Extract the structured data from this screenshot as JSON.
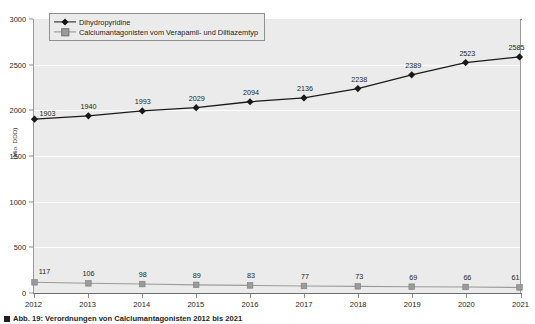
{
  "chart_data": {
    "type": "line",
    "title": "",
    "subtitle": "",
    "xlabel": "",
    "ylabel": "(Mio. DDD)",
    "categories": [
      "2012",
      "2013",
      "2014",
      "2015",
      "2016",
      "2017",
      "2018",
      "2019",
      "2020",
      "2021"
    ],
    "ylim": [
      0,
      3000
    ],
    "y_ticks": [
      0,
      500,
      1000,
      1500,
      2000,
      2500,
      3000
    ],
    "y_tick_labels": [
      "0",
      "500",
      "1000",
      "1500",
      "2000",
      "2500",
      "3000"
    ],
    "grid": true,
    "legend_position": "top-left",
    "series": [
      {
        "name": "Dihydropyridine",
        "marker": "diamond",
        "color": "#1a1a1a",
        "values": [
          1903,
          1940,
          1993,
          2029,
          2094,
          2136,
          2238,
          2389,
          2523,
          2585
        ],
        "labels": [
          "1903",
          "1940",
          "1993",
          "2029",
          "2094",
          "2136",
          "2238",
          "2389",
          "2523",
          "2585"
        ]
      },
      {
        "name": "Calciumantagonisten vom Verapamil- und Diltiazemtyp",
        "marker": "square",
        "color": "#9b9b9b",
        "values": [
          117,
          106,
          98,
          89,
          83,
          77,
          73,
          69,
          66,
          61
        ],
        "labels": [
          "117",
          "106",
          "98",
          "89",
          "83",
          "77",
          "73",
          "69",
          "66",
          "61"
        ]
      }
    ]
  },
  "caption": {
    "text": "Abb. 19: Verordnungen von Calciumantagonisten 2012 bis 2021"
  }
}
